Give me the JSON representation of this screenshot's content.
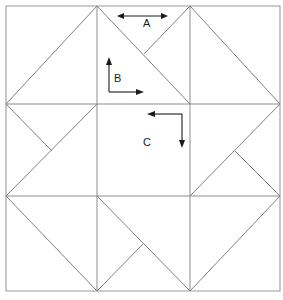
{
  "figure": {
    "kind": "quilt-block-diagram",
    "background_color": "#ffffff",
    "line_color": "#808080",
    "annotation_color": "#1a1a1a"
  },
  "block": {
    "outer_square": {
      "left": 6,
      "top": 6,
      "right": 280,
      "bottom": 291
    },
    "grid": {
      "vertical_lines_x": [
        97,
        190
      ],
      "horizontal_lines_y": [
        104,
        196
      ]
    },
    "columns": [
      "left",
      "center",
      "right"
    ],
    "rows": [
      "top",
      "middle",
      "bottom"
    ]
  },
  "annotations": {
    "arrow_a": {
      "label": "A",
      "style": "double-headed-horizontal",
      "heads": [
        "left",
        "right"
      ],
      "x_start": 117,
      "x_end": 168,
      "y": 16,
      "label_x": 143,
      "label_y": 18
    },
    "arrow_b": {
      "label": "B",
      "style": "corner-up-right",
      "heads": [
        "up",
        "right"
      ],
      "corner_x": 109,
      "corner_y": 92,
      "up_to_y": 59,
      "right_to_x": 142,
      "label_x": 114,
      "label_y": 73
    },
    "arrow_c": {
      "label": "C",
      "style": "corner-left-down",
      "heads": [
        "left",
        "down"
      ],
      "corner_x": 182,
      "corner_y": 114,
      "left_to_x": 148,
      "down_to_y": 147,
      "label_x": 143,
      "label_y": 137
    }
  },
  "labels": {
    "a": "A",
    "b": "B",
    "c": "C"
  }
}
